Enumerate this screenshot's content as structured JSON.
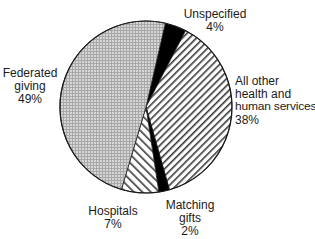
{
  "chart_data": {
    "type": "pie",
    "title": "",
    "start_angle_deg": 13,
    "direction": "clockwise",
    "slices": [
      {
        "label": "Unspecified",
        "value": 4,
        "display": "4%",
        "fill": "solid-black"
      },
      {
        "label": "All other health and human services",
        "value": 38,
        "display": "38%",
        "fill": "back-diagonal-hatch"
      },
      {
        "label": "Matching gifts",
        "value": 2,
        "display": "2%",
        "fill": "solid-black"
      },
      {
        "label": "Hospitals",
        "value": 7,
        "display": "7%",
        "fill": "forward-diagonal-hatch"
      },
      {
        "label": "Federated giving",
        "value": 49,
        "display": "49%",
        "fill": "grey-crosshatch"
      }
    ],
    "legend": "none (direct labels)",
    "colors": {
      "outline": "#1a1a1a",
      "solid": "#000000",
      "crosshatch_bg": "#d4d4d4",
      "crosshatch_line": "#9a9a9a",
      "hatch_line": "#3a3a3a",
      "background": "#ffffff"
    }
  },
  "labels": {
    "unspecified": {
      "lines": [
        "Unspecified"
      ],
      "pct": "4%"
    },
    "all_other": {
      "lines": [
        "All other",
        "health and",
        "human services"
      ],
      "pct": "38%"
    },
    "matching": {
      "lines": [
        "Matching",
        "gifts"
      ],
      "pct": "2%"
    },
    "hospitals": {
      "lines": [
        "Hospitals"
      ],
      "pct": "7%"
    },
    "federated": {
      "lines": [
        "Federated",
        "giving"
      ],
      "pct": "49%"
    }
  }
}
